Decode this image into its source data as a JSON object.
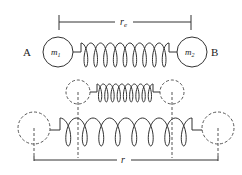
{
  "diagram": {
    "labels": {
      "atom_a": "A",
      "atom_b": "B",
      "mass_1": "m",
      "mass_1_sub": "1",
      "mass_2": "m",
      "mass_2_sub": "2",
      "equilibrium_distance": "r",
      "equilibrium_distance_sub": "e",
      "distance": "r"
    },
    "states": [
      "equilibrium",
      "compressed",
      "stretched"
    ],
    "colors": {
      "stroke": "#333333",
      "background": "#ffffff"
    }
  }
}
